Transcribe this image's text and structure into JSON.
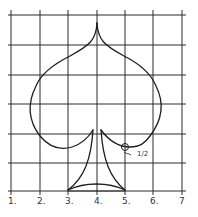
{
  "diagram": {
    "colors": {
      "ink": "#1e1e1e",
      "paper": "#ffffff",
      "grid": "#2a2a2a"
    },
    "x_axis_labels": [
      "1.",
      "2.",
      "3.",
      "4.",
      "5.",
      "6.",
      "7"
    ],
    "grid_columns": 6,
    "grid_rows": 6,
    "annotation": {
      "label": "1/2",
      "marker": "circle",
      "grid_point": [
        5,
        2
      ]
    }
  }
}
